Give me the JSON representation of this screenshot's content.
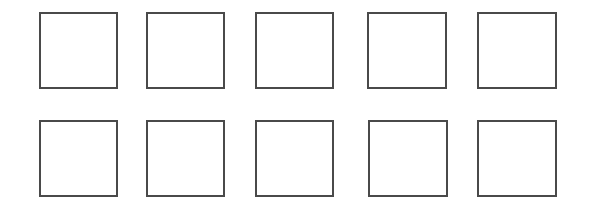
{
  "diagram": {
    "rows": 2,
    "columns": 5,
    "stroke_color": "#4a4a4a",
    "fill_color": "#ffffff",
    "boxes": [
      {
        "row": 1,
        "col": 1,
        "x": 39,
        "y": 12,
        "w": 79,
        "h": 77
      },
      {
        "row": 1,
        "col": 2,
        "x": 146,
        "y": 12,
        "w": 79,
        "h": 77
      },
      {
        "row": 1,
        "col": 3,
        "x": 255,
        "y": 12,
        "w": 79,
        "h": 77
      },
      {
        "row": 1,
        "col": 4,
        "x": 367,
        "y": 12,
        "w": 80,
        "h": 77
      },
      {
        "row": 1,
        "col": 5,
        "x": 477,
        "y": 12,
        "w": 80,
        "h": 77
      },
      {
        "row": 2,
        "col": 1,
        "x": 39,
        "y": 120,
        "w": 79,
        "h": 77
      },
      {
        "row": 2,
        "col": 2,
        "x": 146,
        "y": 120,
        "w": 79,
        "h": 77
      },
      {
        "row": 2,
        "col": 3,
        "x": 255,
        "y": 120,
        "w": 79,
        "h": 77
      },
      {
        "row": 2,
        "col": 4,
        "x": 368,
        "y": 120,
        "w": 80,
        "h": 77
      },
      {
        "row": 2,
        "col": 5,
        "x": 477,
        "y": 120,
        "w": 80,
        "h": 77
      }
    ]
  }
}
